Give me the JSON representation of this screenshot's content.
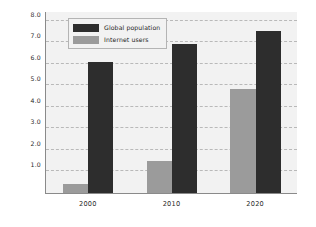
{
  "chart_data": {
    "type": "bar",
    "title": "",
    "xlabel": "",
    "ylabel": "Number of people (billions)",
    "categories": [
      "2000",
      "2010",
      "2020"
    ],
    "yticks": [
      "1.0",
      "2.0",
      "3.0",
      "4.0",
      "5.0",
      "6.0",
      "7.0",
      "8.0"
    ],
    "ytick_values": [
      1.0,
      2.0,
      3.0,
      4.0,
      5.0,
      6.0,
      7.0,
      8.0
    ],
    "ylim": [
      0,
      8.4
    ],
    "grid": true,
    "legend_position": "upper left",
    "series": [
      {
        "name": "Global population",
        "color": "#2d2d2d",
        "values": [
          6.1,
          6.9,
          7.5
        ]
      },
      {
        "name": "Internet users",
        "color": "#9b9b9b",
        "values": [
          0.4,
          1.5,
          4.85
        ]
      }
    ]
  },
  "colors": {
    "global_population": "#2d2d2d",
    "internet_users": "#9b9b9b",
    "plot_background": "#f2f2f2",
    "gridline": "#b9b9b9",
    "axis": "#8a8a8a",
    "figure_background": "#ffffff"
  }
}
